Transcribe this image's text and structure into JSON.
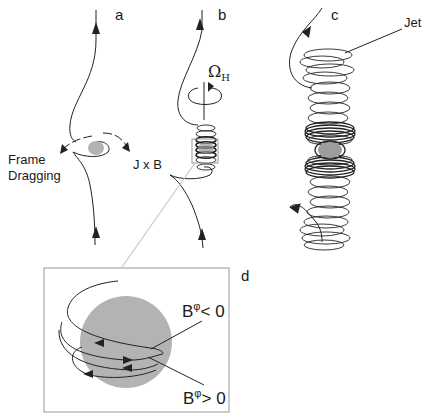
{
  "figure": {
    "panels": [
      {
        "id": "a",
        "label": "a",
        "annotations": [
          "Frame Dragging",
          "J x B"
        ]
      },
      {
        "id": "b",
        "label": "b",
        "annotations": [
          "Ω",
          "H"
        ]
      },
      {
        "id": "c",
        "label": "c",
        "annotations": [
          "Jet"
        ]
      },
      {
        "id": "d",
        "label": "d",
        "annotations": [
          "B",
          "φ",
          "< 0",
          "B",
          "φ",
          "> 0"
        ]
      }
    ],
    "labels": {
      "a": "a",
      "b": "b",
      "c": "c",
      "d": "d",
      "frame_dragging_line1": "Frame",
      "frame_dragging_line2": "Dragging",
      "jxb": "J x B",
      "omega": "Ω",
      "omega_sub": "H",
      "jet": "Jet",
      "b_neg_base": "B",
      "b_neg_sup": "φ",
      "b_neg_rel": "< 0",
      "b_pos_base": "B",
      "b_pos_sup": "φ",
      "b_pos_rel": "> 0"
    },
    "colors": {
      "line": "#222222",
      "sphere": "#b3b3b3",
      "frame": "#9a9a9a",
      "connector": "#c8c8c8"
    }
  }
}
